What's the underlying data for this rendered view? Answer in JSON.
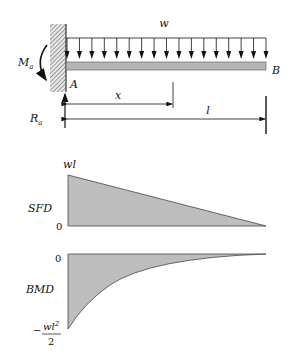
{
  "beam": {
    "load_label": "w",
    "moment_label": "M",
    "moment_sub": "a",
    "reaction_label": "R",
    "reaction_sub": "a",
    "end_a_label": "A",
    "end_b_label": "B",
    "dim_x_label": "x",
    "dim_l_label": "l",
    "load_arrow_count": 17,
    "colors": {
      "beam_fill": "#b5b5b5",
      "diagram_fill": "#bdbdbd",
      "line": "#111111"
    }
  },
  "sfd": {
    "label": "SFD",
    "top_value": "wl",
    "zero": "0"
  },
  "bmd": {
    "label": "BMD",
    "zero": "0",
    "min_numerator": "wl",
    "min_exponent": "2",
    "min_denominator": "2",
    "min_sign": "−"
  },
  "chart_data": [
    {
      "type": "area",
      "title": "SFD",
      "xlabel": "x",
      "ylabel": "Shear force",
      "x": [
        0,
        1
      ],
      "values": [
        1,
        0
      ],
      "ytick_labels": [
        "0",
        "wl"
      ],
      "note": "Linear shear force decreasing from wl at A to 0 at B"
    },
    {
      "type": "area",
      "title": "BMD",
      "xlabel": "x",
      "ylabel": "Bending moment",
      "x": [
        0,
        0.25,
        0.5,
        0.75,
        1
      ],
      "values": [
        -0.5,
        -0.28125,
        -0.125,
        -0.03125,
        0
      ],
      "ytick_labels": [
        "-wl^2/2",
        "0"
      ],
      "note": "Parabolic bending moment from -wl^2/2 at A to 0 at B"
    }
  ]
}
